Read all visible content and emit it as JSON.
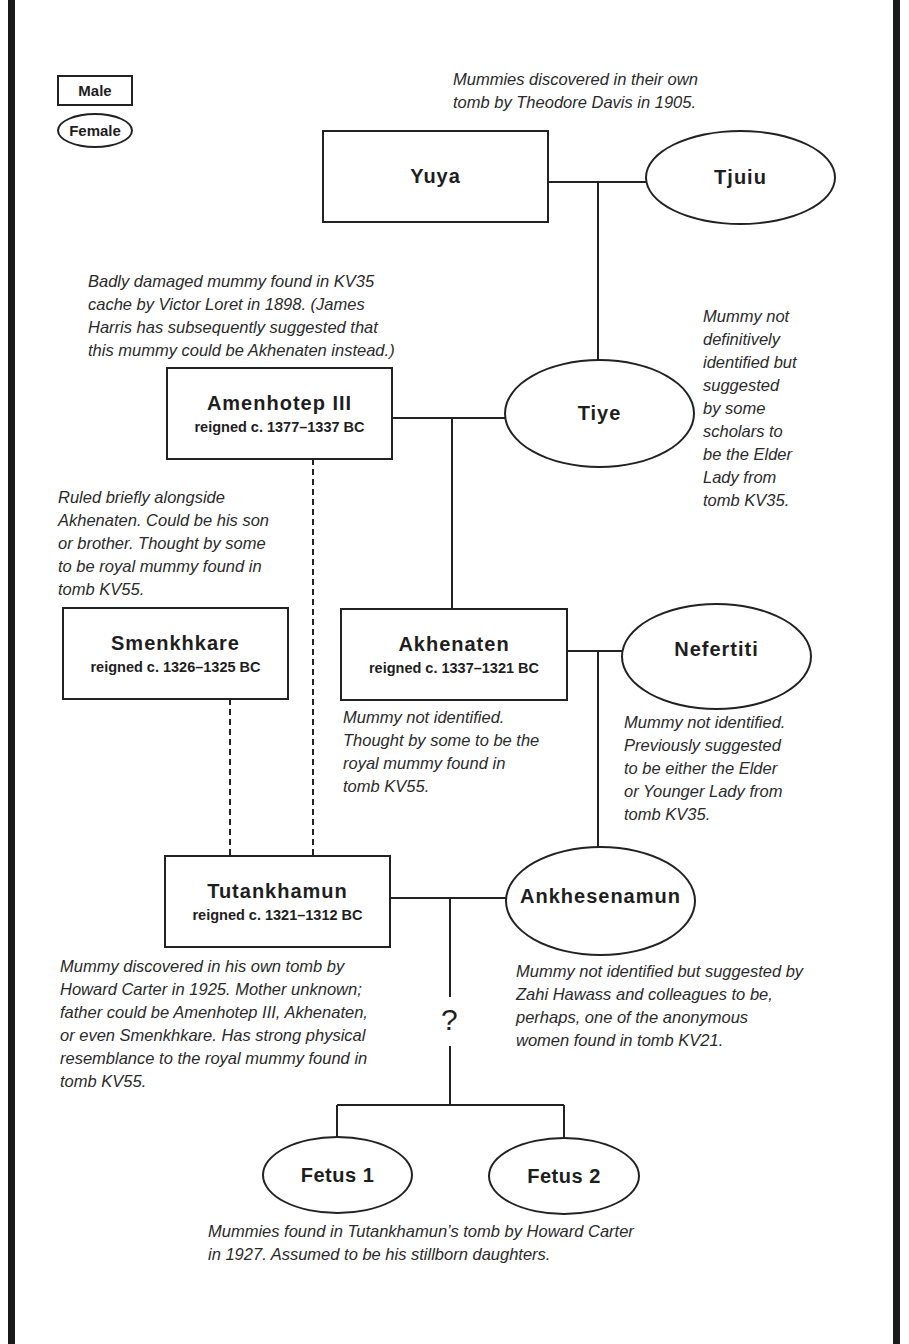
{
  "legend": {
    "male_label": "Male",
    "female_label": "Female"
  },
  "people": {
    "yuya": {
      "name": "Yuya",
      "sex": "male"
    },
    "tjuiu": {
      "name": "Tjuiu",
      "sex": "female"
    },
    "amenhotep3": {
      "name": "Amenhotep III",
      "reign": "reigned c. 1377–1337 BC",
      "sex": "male"
    },
    "tiye": {
      "name": "Tiye",
      "sex": "female"
    },
    "smenkhkare": {
      "name": "Smenkhkare",
      "reign": "reigned c. 1326–1325 BC",
      "sex": "male"
    },
    "akhenaten": {
      "name": "Akhenaten",
      "reign": "reigned c. 1337–1321 BC",
      "sex": "male"
    },
    "nefertiti": {
      "name": "Nefertiti",
      "sex": "female"
    },
    "tutankhamun": {
      "name": "Tutankhamun",
      "reign": "reigned c. 1321–1312 BC",
      "sex": "male"
    },
    "ankhesenamun": {
      "name": "Ankhesenamun",
      "sex": "female"
    },
    "fetus1": {
      "name": "Fetus 1",
      "sex": "female"
    },
    "fetus2": {
      "name": "Fetus 2",
      "sex": "female"
    }
  },
  "notes": {
    "yuya_tjuiu": "Mummies discovered in their own\ntomb by Theodore Davis in 1905.",
    "amenhotep3": "Badly damaged mummy found in KV35\ncache by Victor Loret in 1898. (James\nHarris has subsequently suggested that\nthis mummy could be Akhenaten instead.)",
    "tiye": "Mummy not\ndefinitively\nidentified but\nsuggested\nby some\nscholars to\nbe the Elder\nLady from\ntomb KV35.",
    "smenkhkare": "Ruled briefly alongside\nAkhenaten. Could be his son\nor brother. Thought by some\nto be royal mummy found in\ntomb KV55.",
    "akhenaten": "Mummy not identified.\nThought by some to be the\nroyal mummy found in\ntomb KV55.",
    "nefertiti": "Mummy not identified.\nPreviously suggested\nto be either the Elder\nor Younger Lady from\ntomb KV35.",
    "tutankhamun": "Mummy discovered in his own tomb by\nHoward Carter in 1925. Mother unknown;\nfather could be Amenhotep III, Akhenaten,\nor even Smenkhkare. Has strong physical\nresemblance to the royal mummy found in\ntomb KV55.",
    "ankhesenamun": "Mummy not identified but suggested by\nZahi Hawass and colleagues to be,\nperhaps, one of the anonymous\nwomen found in tomb KV21.",
    "fetuses": "Mummies found in Tutankhamun’s tomb by Howard Carter\nin 1927. Assumed to be his stillborn daughters."
  },
  "uncertain_parentage_mark": "?",
  "colors": {
    "line": "#222222",
    "frame": "#1a1a1a",
    "text": "#1e1e1e",
    "background": "#ffffff"
  }
}
